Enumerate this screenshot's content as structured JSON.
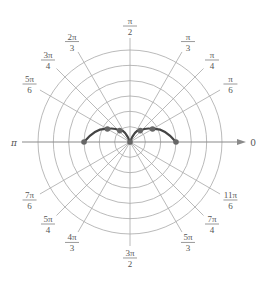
{
  "chart_data": {
    "type": "polar",
    "title": "",
    "center_px": [
      130,
      142
    ],
    "ring_spacing_px": 15.33,
    "rings": [
      1,
      2,
      3,
      4,
      5,
      6
    ],
    "angle_labels": [
      {
        "angle_deg": 0,
        "num": "0",
        "den": ""
      },
      {
        "angle_deg": 30,
        "num": "π",
        "den": "6"
      },
      {
        "angle_deg": 45,
        "num": "π",
        "den": "4"
      },
      {
        "angle_deg": 60,
        "num": "π",
        "den": "3"
      },
      {
        "angle_deg": 90,
        "num": "π",
        "den": "2"
      },
      {
        "angle_deg": 120,
        "num": "2π",
        "den": "3"
      },
      {
        "angle_deg": 135,
        "num": "3π",
        "den": "4"
      },
      {
        "angle_deg": 150,
        "num": "5π",
        "den": "6"
      },
      {
        "angle_deg": 180,
        "num": "π",
        "den": ""
      },
      {
        "angle_deg": 210,
        "num": "7π",
        "den": "6"
      },
      {
        "angle_deg": 225,
        "num": "5π",
        "den": "4"
      },
      {
        "angle_deg": 240,
        "num": "4π",
        "den": "3"
      },
      {
        "angle_deg": 270,
        "num": "3π",
        "den": "2"
      },
      {
        "angle_deg": 300,
        "num": "5π",
        "den": "3"
      },
      {
        "angle_deg": 315,
        "num": "7π",
        "den": "4"
      },
      {
        "angle_deg": 330,
        "num": "11π",
        "den": "6"
      }
    ],
    "polar_axis_arrow": true,
    "curve_points": [
      {
        "theta_deg": 0,
        "r": 3.0
      },
      {
        "theta_deg": 30,
        "r": 1.7
      },
      {
        "theta_deg": 48,
        "r": 1.0
      },
      {
        "theta_deg": 90,
        "r": 0.0
      },
      {
        "theta_deg": 132,
        "r": 1.0
      },
      {
        "theta_deg": 150,
        "r": 1.7
      },
      {
        "theta_deg": 180,
        "r": 3.0
      }
    ],
    "colors": {
      "grid": "#a8a8a8",
      "axis": "#8a8a8a",
      "curve": "#444444",
      "points": "#666666",
      "labels": "#555555"
    }
  }
}
